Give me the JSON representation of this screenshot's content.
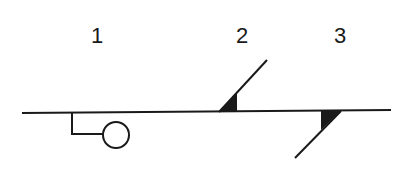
{
  "diagram": {
    "labels": [
      {
        "id": "1",
        "text": "1"
      },
      {
        "id": "2",
        "text": "2"
      },
      {
        "id": "3",
        "text": "3"
      }
    ],
    "symbols": [
      {
        "id": "1",
        "shape": "circle-on-offset-leg"
      },
      {
        "id": "2",
        "shape": "upward-diagonal-with-filled-triangle"
      },
      {
        "id": "3",
        "shape": "downward-diagonal-with-filled-triangle"
      }
    ],
    "colors": {
      "stroke": "#1a1a1a",
      "fill": "#1a1a1a",
      "background": "#ffffff"
    }
  }
}
